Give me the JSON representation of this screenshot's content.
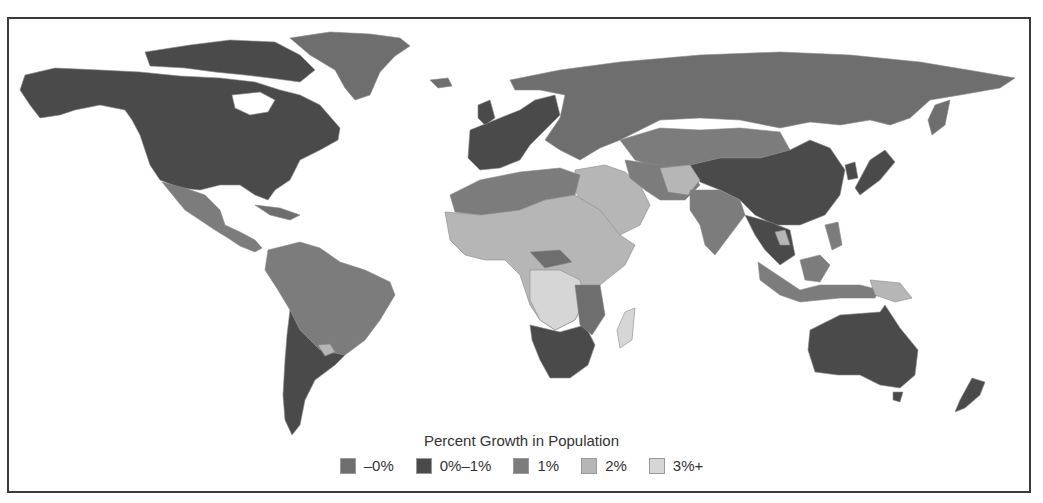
{
  "map": {
    "title": "Percent Growth in Population",
    "type": "choropleth",
    "projection": "world",
    "legend": [
      {
        "label": "–0%",
        "color": "#6e6e6e",
        "key": "neg"
      },
      {
        "label": "0%–1%",
        "color": "#4a4a4a",
        "key": "low"
      },
      {
        "label": "1%",
        "color": "#7c7c7c",
        "key": "one"
      },
      {
        "label": "2%",
        "color": "#b6b6b6",
        "key": "two"
      },
      {
        "label": "3%+",
        "color": "#d6d6d6",
        "key": "three"
      }
    ],
    "regions": [
      {
        "name": "North America (USA/Canada)",
        "category": "0%–1%"
      },
      {
        "name": "Greenland",
        "category": "–0%"
      },
      {
        "name": "Mexico & Central America",
        "category": "1%"
      },
      {
        "name": "South America (Brazil etc.)",
        "category": "1%"
      },
      {
        "name": "Argentina/Chile/Uruguay",
        "category": "0%–1%"
      },
      {
        "name": "Europe",
        "category": "–0%"
      },
      {
        "name": "Western Europe",
        "category": "0%–1%"
      },
      {
        "name": "Russia",
        "category": "–0%"
      },
      {
        "name": "China",
        "category": "0%–1%"
      },
      {
        "name": "Mongolia/Kazakhstan",
        "category": "1%"
      },
      {
        "name": "Middle East",
        "category": "2%"
      },
      {
        "name": "India/South Asia",
        "category": "1%"
      },
      {
        "name": "North Africa",
        "category": "1%"
      },
      {
        "name": "Sub-Saharan Africa",
        "category": "2%"
      },
      {
        "name": "Central Africa",
        "category": "3%+"
      },
      {
        "name": "Southern Africa",
        "category": "0%–1%"
      },
      {
        "name": "Madagascar",
        "category": "3%+"
      },
      {
        "name": "Southeast Asia",
        "category": "1%"
      },
      {
        "name": "Australia",
        "category": "0%–1%"
      },
      {
        "name": "New Zealand",
        "category": "0%–1%"
      },
      {
        "name": "Japan",
        "category": "0%–1%"
      }
    ]
  }
}
